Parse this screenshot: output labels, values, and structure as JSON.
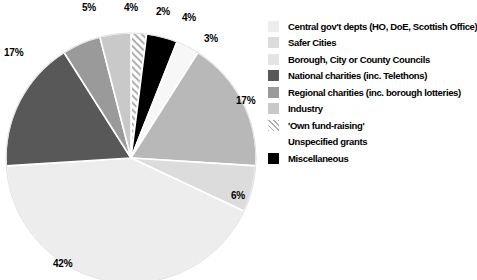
{
  "chart_data": {
    "type": "pie",
    "title": "",
    "categories": [
      "Central gov't depts (HO, DoE, Scottish Office)",
      "Safer Cities",
      "Borough, City or County Councils",
      "National charities (inc. Telethons)",
      "Regional charities (inc. borough lotteries)",
      "Industry",
      "'Own fund-raising'",
      "Unspecified grants",
      "Miscellaneous"
    ],
    "values": [
      42,
      6,
      17,
      17,
      5,
      4,
      2,
      3,
      4
    ],
    "value_labels": [
      "42%",
      "6%",
      "17%",
      "17%",
      "5%",
      "4%",
      "2%",
      "3%",
      "4%"
    ],
    "colors": [
      "#ededed",
      "#dcdcdc",
      "#b8b8b8",
      "#585858",
      "#9a9a9a",
      "#c9c9c9",
      "#ffffff",
      "#f7f7f7",
      "#000000"
    ],
    "legend_position": "right",
    "grid": false,
    "xlabel": "",
    "ylabel": ""
  },
  "legend": {
    "items": [
      {
        "label": "Central gov't depts (HO, DoE, Scottish Office)",
        "color": "#ededed",
        "swatch": "solid"
      },
      {
        "label": "Safer Cities",
        "color": "#dcdcdc",
        "swatch": "solid"
      },
      {
        "label": "Borough, City or County Councils",
        "color": "#e4e4e4",
        "swatch": "solid"
      },
      {
        "label": "National charities (inc. Telethons)",
        "color": "#585858",
        "swatch": "solid"
      },
      {
        "label": "Regional charities (inc. borough lotteries)",
        "color": "#9a9a9a",
        "swatch": "solid"
      },
      {
        "label": "Industry",
        "color": "#c9c9c9",
        "swatch": "solid"
      },
      {
        "label": "'Own fund-raising'",
        "color": "#ffffff",
        "swatch": "hatch"
      },
      {
        "label": "Unspecified grants",
        "color": "#ffffff",
        "swatch": "none"
      },
      {
        "label": "Miscellaneous",
        "color": "#000000",
        "swatch": "solid"
      }
    ]
  },
  "pie_labels": [
    {
      "text": "5%",
      "left": 82,
      "top": 2
    },
    {
      "text": "4%",
      "left": 124,
      "top": 2
    },
    {
      "text": "2%",
      "left": 156,
      "top": 6
    },
    {
      "text": "4%",
      "left": 182,
      "top": 12
    },
    {
      "text": "3%",
      "left": 204,
      "top": 33
    },
    {
      "text": "17%",
      "left": 4,
      "top": 47
    },
    {
      "text": "17%",
      "left": 236,
      "top": 95
    },
    {
      "text": "6%",
      "left": 231,
      "top": 190
    },
    {
      "text": "42%",
      "left": 53,
      "top": 258
    }
  ]
}
